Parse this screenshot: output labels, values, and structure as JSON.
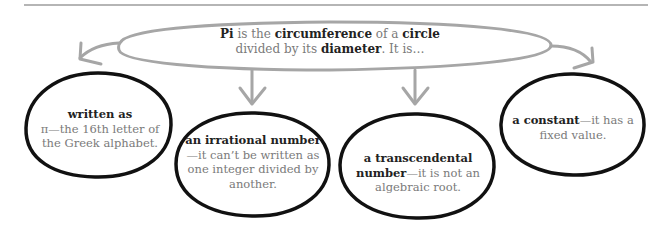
{
  "diagram": {
    "type": "concept-map",
    "colors": {
      "connector": "#a6a6a6",
      "bubble_outline": "#111111",
      "emphasis_text": "#222222",
      "body_text": "#7a7a7a",
      "top_rule": "#b5b5b5"
    },
    "central": {
      "parts": [
        {
          "text": "Pi",
          "bold": true
        },
        {
          "text": " is the ",
          "bold": false
        },
        {
          "text": "circumference",
          "bold": true
        },
        {
          "text": " of a ",
          "bold": false
        },
        {
          "text": "circle",
          "bold": true
        },
        {
          "text": " divided by its ",
          "bold": false
        },
        {
          "text": "diameter",
          "bold": true
        },
        {
          "text": ". It is…",
          "bold": false
        }
      ]
    },
    "bubbles": [
      {
        "id": "written-as",
        "bold": "written as",
        "rest": "π—the 16th letter of the Greek alphabet."
      },
      {
        "id": "irrational",
        "bold": "an irrational number",
        "rest": "—it can’t be written as one integer divided by another."
      },
      {
        "id": "transcendental",
        "bold": "a transcendental number",
        "rest": "—it is not an algebraic root."
      },
      {
        "id": "constant",
        "bold": "a constant",
        "rest": "—it has a fixed value."
      }
    ]
  }
}
